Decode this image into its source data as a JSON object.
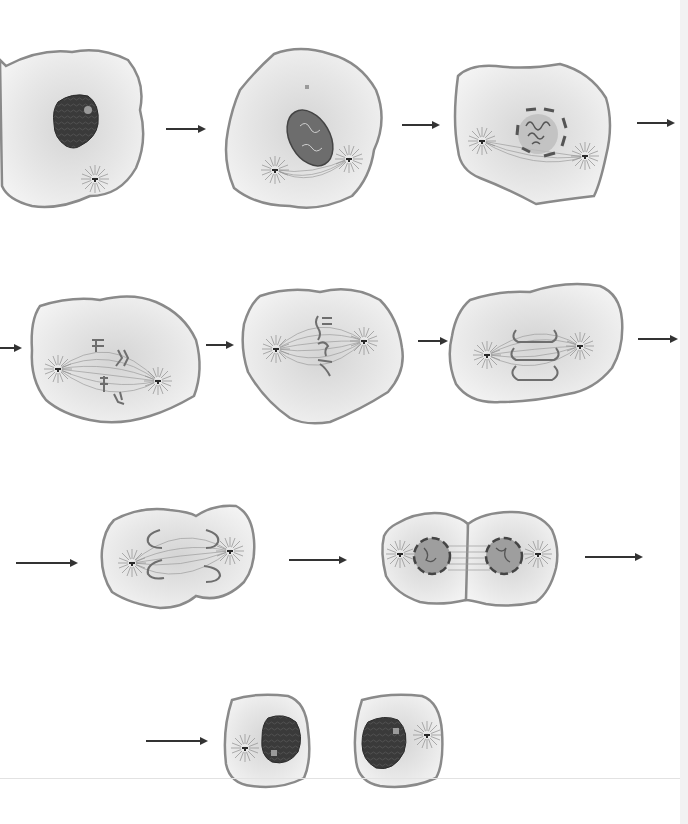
{
  "diagram": {
    "title": "Stages of mitosis in an animal cell",
    "text_labels_visible": false,
    "colors": {
      "background": "#ffffff",
      "cytoplasm": "#ececec",
      "cytoplasm_center": "#d9d9d9",
      "membrane": "#8a8a8a",
      "nucleus": "#3a3a3a",
      "nucleolus": "#9a9a9a",
      "chromosome": "#6e6e6e",
      "spindle": "#9c9c9c",
      "centrosome": "#2a2a2a",
      "nuclear_envelope_fragment": "#555555",
      "arrow": "#333333"
    },
    "stages": [
      {
        "id": "interphase",
        "name": "Interphase",
        "row": 1,
        "order": 1
      },
      {
        "id": "prophase",
        "name": "Prophase",
        "row": 1,
        "order": 2
      },
      {
        "id": "prometaphase-early",
        "name": "Prometaphase (nuclear envelope breaking down)",
        "row": 1,
        "order": 3
      },
      {
        "id": "prometaphase",
        "name": "Prometaphase",
        "row": 2,
        "order": 4
      },
      {
        "id": "metaphase",
        "name": "Metaphase",
        "row": 2,
        "order": 5
      },
      {
        "id": "anaphase",
        "name": "Anaphase",
        "row": 2,
        "order": 6
      },
      {
        "id": "late-anaphase",
        "name": "Late anaphase / early telophase",
        "row": 3,
        "order": 7
      },
      {
        "id": "telophase",
        "name": "Telophase and cytokinesis",
        "row": 3,
        "order": 8
      },
      {
        "id": "daughter-cells",
        "name": "Two daughter cells (interphase)",
        "row": 4,
        "order": 9
      }
    ],
    "arrows": [
      {
        "id": "arrow-1",
        "from": "interphase",
        "to": "prophase"
      },
      {
        "id": "arrow-2",
        "from": "prophase",
        "to": "prometaphase-early"
      },
      {
        "id": "arrow-3",
        "from": "prometaphase-early",
        "to": "next-row"
      },
      {
        "id": "arrow-4",
        "from": "previous-row",
        "to": "prometaphase"
      },
      {
        "id": "arrow-5",
        "from": "prometaphase",
        "to": "metaphase"
      },
      {
        "id": "arrow-6",
        "from": "metaphase",
        "to": "anaphase"
      },
      {
        "id": "arrow-7",
        "from": "anaphase",
        "to": "next-row"
      },
      {
        "id": "arrow-8",
        "from": "previous-row",
        "to": "late-anaphase"
      },
      {
        "id": "arrow-9",
        "from": "late-anaphase",
        "to": "telophase"
      },
      {
        "id": "arrow-10",
        "from": "telophase",
        "to": "next-row"
      },
      {
        "id": "arrow-11",
        "from": "previous-row",
        "to": "daughter-cells"
      }
    ]
  }
}
